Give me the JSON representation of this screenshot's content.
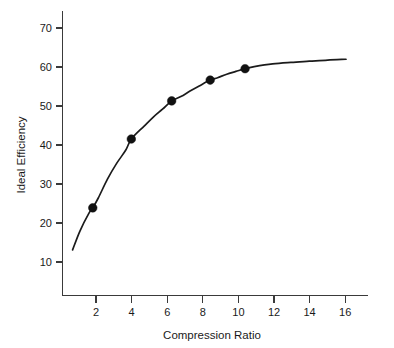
{
  "chart_data": {
    "type": "line",
    "title": "",
    "subtitle": "",
    "xlabel": "Compression Ratio",
    "ylabel": "Ideal Efficiency",
    "xlim": [
      0.55,
      17.2
    ],
    "ylim": [
      2.0,
      74.5
    ],
    "xticks": [
      2,
      4,
      6,
      8,
      10,
      12,
      14,
      16
    ],
    "yticks": [
      10,
      20,
      30,
      40,
      50,
      60,
      70
    ],
    "xticklabels": [
      "2",
      "4",
      "6",
      "8",
      "10",
      "12",
      "14",
      "16"
    ],
    "yticklabels": [
      "10",
      "20",
      "30",
      "40",
      "50",
      "60",
      "70"
    ],
    "grid": false,
    "legend": null,
    "legend_position": "none",
    "series": [
      {
        "name": "Ideal Efficiency",
        "kind": "curve",
        "x": [
          1.1,
          1.5,
          2.0,
          2.2,
          2.5,
          3.0,
          3.5,
          4.0,
          4.3,
          5.0,
          5.5,
          6.0,
          6.5,
          7.0,
          7.5,
          8.0,
          8.6,
          9.0,
          9.5,
          10.0,
          10.5,
          11.0,
          12.0,
          13.0,
          14.0,
          15.0,
          16.0
        ],
        "y": [
          13.6,
          18.4,
          23.0,
          24.3,
          26.8,
          31.6,
          35.6,
          39.0,
          41.8,
          45.1,
          47.4,
          49.4,
          51.5,
          52.6,
          54.0,
          55.3,
          56.8,
          57.4,
          58.3,
          59.0,
          59.7,
          60.2,
          60.9,
          61.3,
          61.6,
          61.9,
          62.1
        ]
      },
      {
        "name": "Measured points",
        "kind": "markers",
        "x": [
          2.2,
          4.3,
          6.5,
          8.6,
          10.5
        ],
        "y": [
          24.3,
          41.8,
          51.5,
          56.8,
          59.7
        ]
      }
    ],
    "marker_style": "filled-circle",
    "marker_size": 5,
    "line_color": "#1b1b1b",
    "marker_color": "#111111",
    "axis_color": "#3a3a3a",
    "background_color": "#ffffff"
  },
  "axes": {
    "x_axis_name": "Compression Ratio",
    "y_axis_name": "Ideal Efficiency"
  }
}
